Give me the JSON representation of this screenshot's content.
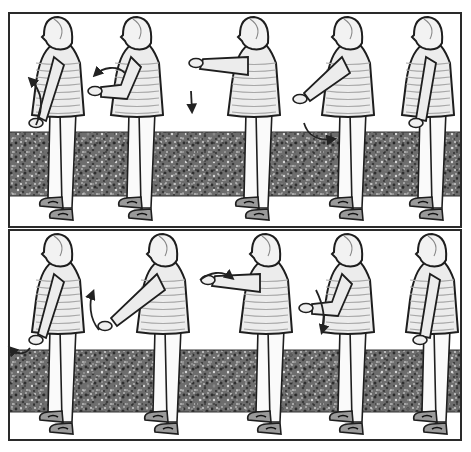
{
  "figure": {
    "colors": {
      "background": "#ffffff",
      "frame": "#2a2a2a",
      "gravel_base": "#6d6d6d",
      "gravel_dark": "#2e2e2e",
      "gravel_light": "#c9c9c9",
      "outline": "#1e1e1e",
      "sweater": "#ececec",
      "sweater_stripe": "#a8a8a8",
      "pants": "#fafafa",
      "shoe": "#9a9a9a",
      "arrow": "#222222"
    },
    "panels": [
      {
        "name": "top",
        "frame": {
          "x": 9,
          "y": 13,
          "w": 452,
          "h": 214
        },
        "band": {
          "y": 132,
          "h": 64
        },
        "ground_y": 222,
        "figures": [
          {
            "x": 58,
            "arm": "down-back",
            "arrow": "up-curve-left"
          },
          {
            "x": 137,
            "arm": "bent-front",
            "arrow": "curve-back"
          },
          {
            "x": 254,
            "arm": "extended-front",
            "arrow": "down"
          },
          {
            "x": 348,
            "arm": "low-front",
            "arrow": "curve-under"
          },
          {
            "x": 428,
            "arm": "down-side",
            "arrow": "none"
          }
        ]
      },
      {
        "name": "bottom",
        "frame": {
          "x": 9,
          "y": 230,
          "w": 452,
          "h": 210
        },
        "band": {
          "y": 350,
          "h": 62
        },
        "ground_y": 436,
        "figures": [
          {
            "x": 58,
            "arm": "down-back",
            "arrow": "curve-back-low"
          },
          {
            "x": 163,
            "arm": "low-front-long",
            "arrow": "up-curve"
          },
          {
            "x": 266,
            "arm": "extended-front",
            "arrow": "over-curve"
          },
          {
            "x": 348,
            "arm": "bent-front",
            "arrow": "down-diagonal"
          },
          {
            "x": 432,
            "arm": "down-side",
            "arrow": "none"
          }
        ]
      }
    ]
  }
}
